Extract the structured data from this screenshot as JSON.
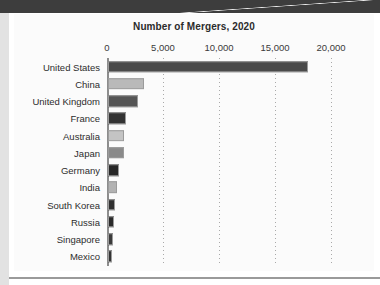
{
  "page": {
    "background_color": "#ffffff",
    "top_band_color": "#3d3d3d",
    "card_background": "#fbfbfb",
    "left_strip_color": "#e2e2e2",
    "bottom_rule_color": "#9a9a9a"
  },
  "chart_data": {
    "type": "bar",
    "orientation": "horizontal",
    "title": "Number of Mergers, 2020",
    "subtitle": "",
    "xlabel": "",
    "ylabel": "",
    "xlim": [
      0,
      20000
    ],
    "grid": true,
    "grid_axis": "x",
    "grid_style": "dotted",
    "legend": "none",
    "xticks": [
      0,
      5000,
      10000,
      15000,
      20000
    ],
    "xtick_labels": [
      "0",
      "5,000",
      "10,000",
      "15,000",
      "20,000"
    ],
    "categories": [
      "United States",
      "China",
      "United Kingdom",
      "France",
      "Australia",
      "Japan",
      "Germany",
      "India",
      "South Korea",
      "Russia",
      "Singapore",
      "Mexico"
    ],
    "values": [
      17900,
      3190,
      2700,
      1580,
      1430,
      1430,
      980,
      780,
      650,
      510,
      420,
      350
    ],
    "bar_colors": [
      "#4a4a4a",
      "#b9b9b9",
      "#555555",
      "#333333",
      "#c4c4c4",
      "#8a8a8a",
      "#272727",
      "#b2b2b2",
      "#303030",
      "#2a2a2a",
      "#3a3a3a",
      "#333333"
    ],
    "bar_border_color": "#9b9b9b",
    "axis_line_color": "#8d8d8d",
    "text_color": "#2d2d2d"
  }
}
